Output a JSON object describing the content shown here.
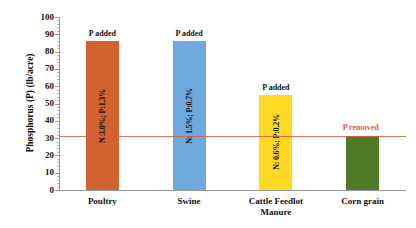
{
  "chart_data": {
    "type": "bar",
    "title": "",
    "xlabel": "",
    "ylabel": "Phosphorus (P) (lb/acre)",
    "ylim": [
      0,
      100
    ],
    "ytick_step": 10,
    "yticks": [
      "0",
      "10",
      "20",
      "30",
      "40",
      "50",
      "60",
      "70",
      "80",
      "90",
      "100"
    ],
    "grid": false,
    "legend": "none",
    "categories": [
      "Poultry",
      "Swine",
      "Cattle Feedlot Manure",
      "Corn grain"
    ],
    "values": [
      86,
      86,
      55,
      31
    ],
    "bar_colors": [
      "#D2622F",
      "#6FA8DC",
      "#FFD924",
      "#4F7A28"
    ],
    "bar_labels": [
      "N:3.0%; P:1.3%",
      "N: 1.5%; P:0.7%",
      "N: 0.6%; P:0.2%",
      ""
    ],
    "bar_annotations": [
      "P added",
      "P added",
      "P added",
      ""
    ],
    "threshold": {
      "value": 31,
      "label": "P removed",
      "color": "#e05a3c",
      "style": "solid-thin"
    }
  },
  "axis": {
    "y_title": "Phosphorus (P) (lb/acre)"
  },
  "categories_multiline": [
    [
      "Poultry"
    ],
    [
      "Swine"
    ],
    [
      "Cattle Feedlot",
      "Manure"
    ],
    [
      "Corn grain"
    ]
  ]
}
